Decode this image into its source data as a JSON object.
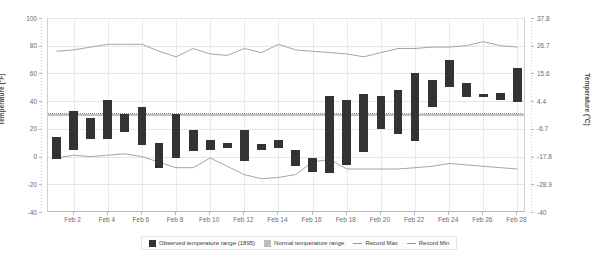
{
  "chart_data": {
    "type": "bar",
    "title": "",
    "subtitle": "",
    "xlabel": "",
    "ylabel": "Temperature (°F)",
    "ylabel_right": "Temperature (°C)",
    "ylim": [
      -40,
      100
    ],
    "ylim_right": [
      -40,
      37.8
    ],
    "grid": true,
    "legend_position": "bottom",
    "x": [
      "Feb 1",
      "Feb 2",
      "Feb 3",
      "Feb 4",
      "Feb 5",
      "Feb 6",
      "Feb 7",
      "Feb 8",
      "Feb 9",
      "Feb 10",
      "Feb 11",
      "Feb 12",
      "Feb 13",
      "Feb 14",
      "Feb 15",
      "Feb 16",
      "Feb 17",
      "Feb 18",
      "Feb 19",
      "Feb 20",
      "Feb 21",
      "Feb 22",
      "Feb 23",
      "Feb 24",
      "Feb 25",
      "Feb 26",
      "Feb 27",
      "Feb 28"
    ],
    "x_tick_labels": [
      "Feb 2",
      "Feb 4",
      "Feb 6",
      "Feb 8",
      "Feb 10",
      "Feb 12",
      "Feb 14",
      "Feb 16",
      "Feb 18",
      "Feb 20",
      "Feb 22",
      "Feb 24",
      "Feb 26",
      "Feb 28"
    ],
    "y_tick_labels_left": [
      "100",
      "80",
      "60",
      "40",
      "20",
      "0",
      "-20",
      "-40"
    ],
    "y_tick_values_left": [
      100,
      80,
      60,
      40,
      20,
      0,
      -20,
      -40
    ],
    "y_tick_labels_right": [
      "37.8",
      "26.7",
      "15.6",
      "4.4",
      "-6.7",
      "-17.8",
      "-28.9",
      "-40"
    ],
    "y_tick_values_right": [
      37.8,
      26.7,
      15.6,
      4.4,
      -6.7,
      -17.8,
      -28.9,
      -40
    ],
    "series": [
      {
        "name": "Observed temperature range (1895)",
        "type": "range-bar",
        "color": "#333333",
        "low": [
          -2,
          5,
          13,
          13,
          18,
          8,
          -8,
          -1,
          4,
          5,
          6,
          -3,
          5,
          6,
          -7,
          -11,
          -12,
          -6,
          3,
          20,
          16,
          11,
          36,
          50,
          43,
          43,
          41,
          39
        ],
        "high": [
          14,
          33,
          28,
          41,
          31,
          36,
          10,
          31,
          19,
          12,
          10,
          19,
          9,
          12,
          5,
          -1,
          44,
          41,
          45,
          44,
          48,
          60,
          55,
          70,
          53,
          45,
          46,
          64
        ]
      },
      {
        "name": "Normal temperature range",
        "type": "band",
        "color": "#bdbdbd",
        "low": [
          29,
          29,
          29,
          29,
          29,
          29,
          29,
          29,
          29,
          29,
          29,
          29,
          29,
          29,
          29,
          29,
          29,
          29,
          29,
          29,
          29,
          29,
          29,
          29,
          29,
          29,
          29,
          29
        ],
        "high": [
          31,
          31,
          31,
          31,
          31,
          31,
          31,
          31,
          31,
          31,
          31,
          31,
          31,
          31,
          31,
          31,
          31,
          31,
          31,
          31,
          31,
          31,
          31,
          31,
          31,
          31,
          31,
          31
        ]
      },
      {
        "name": "Record Max",
        "type": "line",
        "color": "#9a9a9a",
        "values": [
          76,
          77,
          79,
          81,
          81,
          81,
          76,
          72,
          78,
          74,
          73,
          78,
          75,
          81,
          77,
          76,
          75,
          74,
          72,
          75,
          78,
          78,
          79,
          79,
          80,
          83,
          80,
          79
        ]
      },
      {
        "name": "Record Min",
        "type": "line",
        "color": "#9a9a9a",
        "values": [
          -1,
          1,
          0,
          1,
          2,
          0,
          -4,
          -8,
          -8,
          -1,
          -7,
          -13,
          -16,
          -15,
          -13,
          -4,
          -2,
          -9,
          -9,
          -9,
          -9,
          -8,
          -7,
          -5,
          -6,
          -7,
          -8,
          -9
        ]
      }
    ],
    "legend": [
      {
        "label": "Observed temperature range (1895)",
        "marker": "square",
        "color": "#333333"
      },
      {
        "label": "Normal temperature range",
        "marker": "square",
        "color": "#bdbdbd"
      },
      {
        "label": "Record Max",
        "marker": "line",
        "color": "#9a9a9a"
      },
      {
        "label": "Record Min",
        "marker": "line",
        "color": "#9a9a9a"
      }
    ]
  }
}
